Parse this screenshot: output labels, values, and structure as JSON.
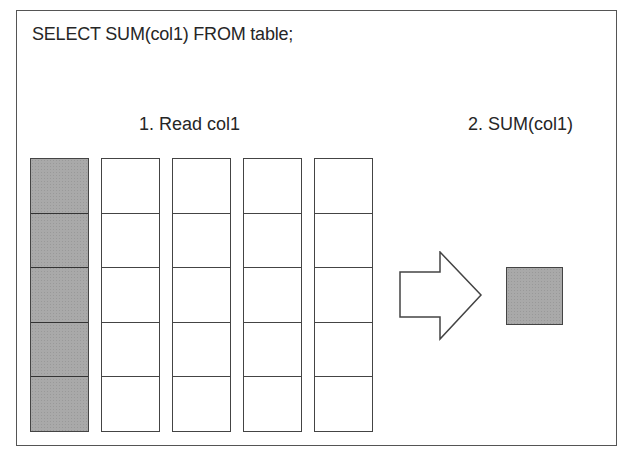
{
  "diagram": {
    "query": "SELECT SUM(col1) FROM table;",
    "steps": [
      {
        "label": "1. Read col1"
      },
      {
        "label": "2. SUM(col1)"
      }
    ],
    "table": {
      "columns": [
        "col1",
        "col2",
        "col3",
        "col4",
        "col5"
      ],
      "rows": 5,
      "highlighted_column": "col1"
    },
    "arrow": "right-arrow",
    "result": "sum-result-cell",
    "colors": {
      "border": "#444444",
      "highlight_fill": "#a9a9a9",
      "background": "#ffffff"
    }
  }
}
